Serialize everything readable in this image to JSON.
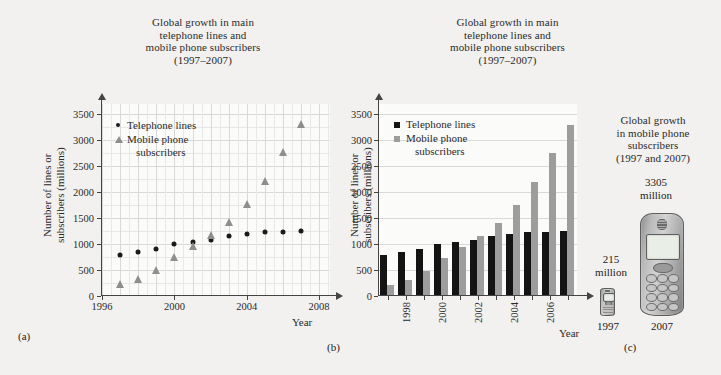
{
  "figure": {
    "panels": [
      {
        "caption": "(a)"
      },
      {
        "caption": "(b)"
      },
      {
        "caption": "(c)"
      }
    ]
  },
  "chart_data": [
    {
      "type": "scatter",
      "panel": "(a)",
      "title": "Global growth in main\ntelephone lines and\nmobile phone subscribers\n(1997–2007)",
      "title_lines": [
        "Global growth in main",
        "telephone lines and",
        "mobile phone subscribers",
        "(1997–2007)"
      ],
      "xlabel": "Year",
      "ylabel": "Number of lines or\nsubscribers (millions)",
      "ylabel_lines": [
        "Number of lines or",
        "subscribers (millions)"
      ],
      "grid": true,
      "xlim": [
        1996,
        2008.6
      ],
      "ylim": [
        0,
        3700
      ],
      "yticks": [
        0,
        500,
        1000,
        1500,
        2000,
        2500,
        3000,
        3500
      ],
      "ytick_labels": [
        "0",
        "500",
        "1000",
        "1500",
        "2000",
        "2500",
        "3000",
        "3500"
      ],
      "xticks": [
        1996,
        2000,
        2004,
        2008
      ],
      "xtick_labels": [
        "1996",
        "2000",
        "2004",
        "2008"
      ],
      "x": [
        1997,
        1998,
        1999,
        2000,
        2001,
        2002,
        2003,
        2004,
        2005,
        2006,
        2007
      ],
      "legend_position": "upper-left",
      "series": [
        {
          "name": "Telephone lines",
          "marker": "circle",
          "color": "#1b1b1b",
          "values": [
            790,
            850,
            900,
            1000,
            1040,
            1080,
            1150,
            1200,
            1240,
            1240,
            1260
          ]
        },
        {
          "name": "Mobile phone subscribers",
          "marker": "triangle",
          "color": "#8e8e8e",
          "label_lines": [
            "Mobile phone",
            "subscribers"
          ],
          "values": [
            215,
            305,
            490,
            740,
            950,
            1160,
            1400,
            1750,
            2200,
            2750,
            3305
          ]
        }
      ]
    },
    {
      "type": "bar",
      "panel": "(b)",
      "title": "Global growth in main\ntelephone lines and\nmobile phone subscribers\n(1997–2007)",
      "title_lines": [
        "Global growth in main",
        "telephone lines and",
        "mobile phone subscribers",
        "(1997–2007)"
      ],
      "xlabel": "Year",
      "ylabel": "Number of lines or\nsubscribers (millions)",
      "ylabel_lines": [
        "Number of lines or",
        "subscribers (millions)"
      ],
      "grid": true,
      "ylim": [
        0,
        3700
      ],
      "yticks": [
        0,
        500,
        1000,
        1500,
        2000,
        2500,
        3000,
        3500
      ],
      "ytick_labels": [
        "0",
        "500",
        "1000",
        "1500",
        "2000",
        "2500",
        "3000",
        "3500"
      ],
      "categories": [
        "1997",
        "1998",
        "1999",
        "2000",
        "2001",
        "2002",
        "2003",
        "2004",
        "2005",
        "2006",
        "2007"
      ],
      "xtick_labels_shown": [
        "1998",
        "2000",
        "2002",
        "2004",
        "2006"
      ],
      "legend_position": "upper-left",
      "series": [
        {
          "name": "Telephone lines",
          "color": "#141414",
          "values": [
            790,
            850,
            900,
            1000,
            1040,
            1080,
            1150,
            1200,
            1240,
            1240,
            1260
          ]
        },
        {
          "name": "Mobile phone subscribers",
          "color": "#9d9d9d",
          "label_lines": [
            "Mobile phone",
            "subscribers"
          ],
          "values": [
            215,
            305,
            490,
            740,
            950,
            1160,
            1400,
            1750,
            2200,
            2750,
            3305
          ]
        }
      ]
    },
    {
      "type": "pictogram",
      "panel": "(c)",
      "title": "Global growth\nin mobile phone\nsubscribers\n(1997 and 2007)",
      "title_lines": [
        "Global growth",
        "in mobile phone",
        "subscribers",
        "(1997 and 2007)"
      ],
      "categories": [
        "1997",
        "2007"
      ],
      "values": [
        215,
        3305
      ],
      "value_labels": [
        [
          "215",
          "million"
        ],
        [
          "3305",
          "million"
        ]
      ],
      "unit": "million",
      "icon": "mobile-phone-icon"
    }
  ]
}
